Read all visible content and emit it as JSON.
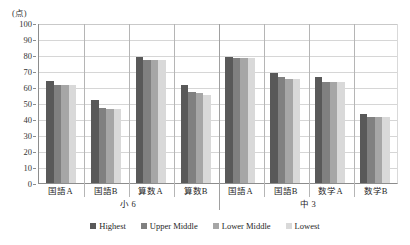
{
  "chart_data": {
    "type": "bar",
    "title": "",
    "xlabel": "",
    "ylabel": "(点)",
    "ylim": [
      0,
      100
    ],
    "yticks": [
      0,
      10,
      20,
      30,
      40,
      50,
      60,
      70,
      80,
      90,
      100
    ],
    "grid": true,
    "legend_position": "bottom",
    "categories": [
      "国語A",
      "国語B",
      "算数A",
      "算数B",
      "国語A",
      "国語B",
      "数学A",
      "数学B"
    ],
    "groups": [
      {
        "label": "小 6",
        "span": 4
      },
      {
        "label": "中 3",
        "span": 4
      }
    ],
    "series": [
      {
        "name": "Highest",
        "color": "#595959",
        "values": [
          64,
          52,
          79,
          61,
          79,
          69,
          66,
          43
        ]
      },
      {
        "name": "Upper Middle",
        "color": "#808080",
        "values": [
          61,
          47,
          77,
          57,
          78,
          66,
          63,
          41
        ]
      },
      {
        "name": "Lower Middle",
        "color": "#a6a6a6",
        "values": [
          61,
          46,
          77,
          56,
          78,
          65,
          63,
          41
        ]
      },
      {
        "name": "Lowest",
        "color": "#d9d9d9",
        "values": [
          61,
          46,
          77,
          55,
          78,
          65,
          63,
          41
        ]
      }
    ]
  },
  "axis": {
    "unit_label": "(点)",
    "tick_0": "0",
    "tick_10": "10",
    "tick_20": "20",
    "tick_30": "30",
    "tick_40": "40",
    "tick_50": "50",
    "tick_60": "60",
    "tick_70": "70",
    "tick_80": "80",
    "tick_90": "90",
    "tick_100": "100"
  },
  "legend": {
    "items": [
      {
        "label": "Highest",
        "color": "#595959"
      },
      {
        "label": "Upper Middle",
        "color": "#808080"
      },
      {
        "label": "Lower Middle",
        "color": "#a6a6a6"
      },
      {
        "label": "Lowest",
        "color": "#d9d9d9"
      }
    ]
  }
}
